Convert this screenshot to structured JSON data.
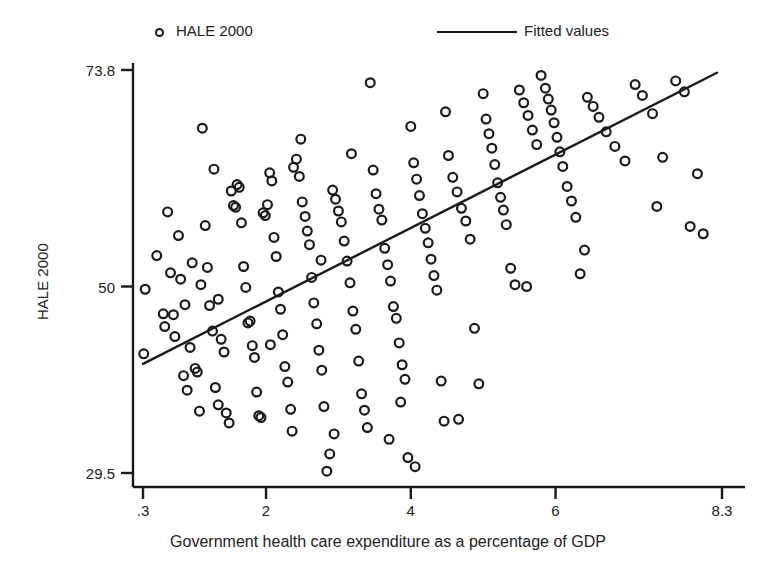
{
  "chart_data": {
    "type": "scatter",
    "title": "",
    "xlabel": "Government health care expenditure as a percentage of GDP",
    "ylabel": "HALE 2000",
    "xlim": [
      0.3,
      8.3
    ],
    "ylim": [
      29.5,
      73.8
    ],
    "xticks": [
      0.3,
      2,
      4,
      6,
      8.3
    ],
    "xtick_labels": [
      ".3",
      "2",
      "4",
      "6",
      "8.3"
    ],
    "yticks": [
      29.5,
      50,
      73.8
    ],
    "ytick_labels": [
      "29.5",
      "50",
      "73.8"
    ],
    "grid": false,
    "legend_position": "top",
    "legend": [
      {
        "label": "HALE 2000",
        "marker": "open-circle",
        "type": "scatter"
      },
      {
        "label": "Fitted values",
        "marker": "line",
        "type": "line"
      }
    ],
    "series": [
      {
        "name": "HALE 2000",
        "marker": "open-circle",
        "color": "#1a1a1a",
        "points": [
          [
            0.33,
            49.7
          ],
          [
            0.31,
            42.6
          ],
          [
            0.49,
            53.4
          ],
          [
            0.58,
            47.0
          ],
          [
            0.6,
            45.6
          ],
          [
            0.64,
            58.2
          ],
          [
            0.72,
            46.9
          ],
          [
            0.74,
            44.5
          ],
          [
            0.79,
            55.6
          ],
          [
            0.82,
            50.8
          ],
          [
            0.86,
            40.2
          ],
          [
            0.91,
            38.6
          ],
          [
            0.95,
            43.3
          ],
          [
            0.98,
            52.6
          ],
          [
            1.02,
            41.0
          ],
          [
            1.05,
            40.6
          ],
          [
            1.08,
            36.3
          ],
          [
            1.12,
            67.4
          ],
          [
            1.16,
            56.7
          ],
          [
            1.19,
            52.1
          ],
          [
            1.22,
            47.9
          ],
          [
            1.26,
            45.1
          ],
          [
            1.3,
            38.9
          ],
          [
            1.34,
            37.0
          ],
          [
            1.38,
            44.2
          ],
          [
            1.42,
            42.8
          ],
          [
            1.45,
            36.1
          ],
          [
            1.49,
            35.0
          ],
          [
            1.52,
            60.5
          ],
          [
            1.55,
            58.9
          ],
          [
            1.58,
            58.7
          ],
          [
            1.6,
            61.2
          ],
          [
            1.63,
            60.9
          ],
          [
            1.66,
            57.0
          ],
          [
            1.69,
            52.2
          ],
          [
            1.72,
            49.9
          ],
          [
            1.75,
            46.0
          ],
          [
            1.78,
            46.2
          ],
          [
            1.81,
            43.5
          ],
          [
            1.84,
            42.2
          ],
          [
            1.87,
            38.4
          ],
          [
            1.9,
            35.8
          ],
          [
            1.93,
            35.6
          ],
          [
            1.96,
            58.1
          ],
          [
            1.99,
            57.8
          ],
          [
            2.02,
            59.0
          ],
          [
            2.05,
            62.5
          ],
          [
            2.08,
            61.6
          ],
          [
            2.11,
            55.4
          ],
          [
            2.14,
            53.3
          ],
          [
            2.17,
            49.4
          ],
          [
            2.2,
            47.5
          ],
          [
            2.23,
            44.7
          ],
          [
            2.26,
            41.2
          ],
          [
            2.3,
            39.5
          ],
          [
            2.34,
            36.5
          ],
          [
            2.38,
            63.1
          ],
          [
            2.42,
            64.0
          ],
          [
            2.46,
            62.1
          ],
          [
            2.5,
            59.3
          ],
          [
            2.54,
            57.7
          ],
          [
            2.57,
            56.1
          ],
          [
            2.6,
            54.6
          ],
          [
            2.63,
            51.0
          ],
          [
            2.66,
            48.2
          ],
          [
            2.7,
            45.9
          ],
          [
            2.73,
            43.0
          ],
          [
            2.77,
            40.8
          ],
          [
            2.8,
            36.8
          ],
          [
            2.84,
            29.7
          ],
          [
            2.88,
            31.6
          ],
          [
            2.92,
            60.6
          ],
          [
            2.96,
            59.6
          ],
          [
            3.0,
            58.3
          ],
          [
            3.04,
            57.1
          ],
          [
            3.08,
            55.0
          ],
          [
            3.12,
            52.8
          ],
          [
            3.16,
            50.4
          ],
          [
            3.2,
            47.3
          ],
          [
            3.24,
            45.3
          ],
          [
            3.28,
            41.8
          ],
          [
            3.32,
            38.2
          ],
          [
            3.36,
            36.4
          ],
          [
            3.4,
            34.5
          ],
          [
            3.44,
            72.4
          ],
          [
            3.48,
            62.8
          ],
          [
            3.52,
            60.2
          ],
          [
            3.56,
            58.5
          ],
          [
            3.6,
            57.3
          ],
          [
            3.64,
            54.2
          ],
          [
            3.68,
            52.4
          ],
          [
            3.72,
            50.6
          ],
          [
            3.76,
            47.8
          ],
          [
            3.8,
            46.5
          ],
          [
            3.84,
            43.8
          ],
          [
            3.88,
            41.4
          ],
          [
            3.92,
            39.8
          ],
          [
            3.96,
            31.2
          ],
          [
            4.0,
            67.6
          ],
          [
            4.04,
            63.6
          ],
          [
            4.08,
            61.8
          ],
          [
            4.12,
            60.0
          ],
          [
            4.16,
            58.0
          ],
          [
            4.2,
            56.4
          ],
          [
            4.24,
            54.8
          ],
          [
            4.28,
            53.0
          ],
          [
            4.32,
            51.2
          ],
          [
            4.36,
            49.6
          ],
          [
            4.42,
            39.6
          ],
          [
            4.48,
            69.2
          ],
          [
            4.52,
            64.4
          ],
          [
            4.58,
            62.0
          ],
          [
            4.64,
            60.4
          ],
          [
            4.7,
            58.6
          ],
          [
            4.76,
            57.2
          ],
          [
            4.82,
            55.2
          ],
          [
            4.88,
            45.4
          ],
          [
            4.94,
            39.3
          ],
          [
            5.0,
            71.2
          ],
          [
            5.04,
            68.4
          ],
          [
            5.08,
            66.8
          ],
          [
            5.12,
            65.2
          ],
          [
            5.16,
            63.4
          ],
          [
            5.2,
            61.4
          ],
          [
            5.24,
            59.8
          ],
          [
            5.28,
            58.4
          ],
          [
            5.32,
            56.8
          ],
          [
            5.38,
            52.0
          ],
          [
            5.44,
            50.2
          ],
          [
            5.5,
            71.6
          ],
          [
            5.56,
            70.2
          ],
          [
            5.62,
            68.8
          ],
          [
            5.68,
            67.2
          ],
          [
            5.74,
            65.6
          ],
          [
            5.8,
            73.2
          ],
          [
            5.86,
            71.8
          ],
          [
            5.9,
            70.6
          ],
          [
            5.94,
            69.4
          ],
          [
            5.98,
            68.0
          ],
          [
            6.02,
            66.4
          ],
          [
            6.06,
            64.8
          ],
          [
            6.1,
            63.2
          ],
          [
            6.16,
            61.0
          ],
          [
            6.22,
            59.4
          ],
          [
            6.28,
            57.6
          ],
          [
            6.34,
            51.4
          ],
          [
            6.44,
            70.8
          ],
          [
            6.52,
            69.8
          ],
          [
            6.6,
            68.6
          ],
          [
            6.7,
            67.0
          ],
          [
            6.82,
            65.4
          ],
          [
            6.96,
            63.8
          ],
          [
            7.1,
            72.2
          ],
          [
            7.2,
            71.0
          ],
          [
            7.34,
            69.0
          ],
          [
            7.48,
            64.2
          ],
          [
            7.66,
            72.6
          ],
          [
            7.78,
            71.4
          ],
          [
            7.86,
            56.6
          ],
          [
            7.96,
            62.4
          ],
          [
            8.04,
            55.8
          ],
          [
            2.48,
            66.2
          ],
          [
            3.18,
            64.6
          ],
          [
            1.28,
            62.9
          ],
          [
            0.68,
            51.5
          ],
          [
            5.6,
            50.0
          ],
          [
            4.06,
            30.2
          ],
          [
            2.94,
            33.8
          ],
          [
            3.7,
            33.2
          ],
          [
            2.36,
            34.1
          ],
          [
            1.34,
            48.6
          ],
          [
            0.88,
            48.0
          ],
          [
            1.1,
            50.2
          ],
          [
            2.06,
            43.6
          ],
          [
            2.76,
            52.9
          ],
          [
            3.86,
            37.3
          ],
          [
            4.46,
            35.2
          ],
          [
            4.66,
            35.4
          ],
          [
            6.4,
            54.0
          ],
          [
            7.4,
            58.8
          ]
        ]
      }
    ],
    "fit_line": {
      "name": "Fitted values",
      "color": "#1a1a1a",
      "x0": 0.3,
      "y0": 41.5,
      "x1": 8.23,
      "y1": 73.5
    }
  }
}
